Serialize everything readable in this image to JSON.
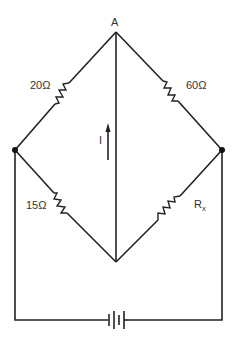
{
  "diagram": {
    "type": "wheatstone-bridge",
    "nodes": {
      "top": {
        "label": "A"
      },
      "left": {
        "label": ""
      },
      "right": {
        "label": ""
      },
      "bottom": {
        "label": ""
      }
    },
    "resistors": {
      "top_left": {
        "label": "20Ω"
      },
      "top_right": {
        "label": "60Ω"
      },
      "bottom_left": {
        "label": "15Ω"
      },
      "bottom_right": {
        "label": "R",
        "subscript": "x"
      }
    },
    "current": {
      "label": "I",
      "direction": "up"
    },
    "source": {
      "type": "battery"
    },
    "colors": {
      "line": "#222222",
      "text": "#333333",
      "background": "#ffffff"
    }
  }
}
